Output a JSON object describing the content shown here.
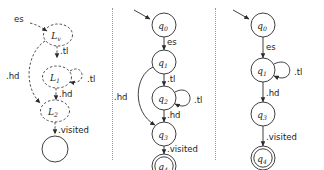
{
  "figure": {
    "background_color": "#ffffff",
    "stroke_color": "#2b2b2b",
    "divider_style": "dotted"
  },
  "panels": [
    {
      "id": "left",
      "style": "dashed",
      "nodes": [
        {
          "id": "Lv",
          "base": "L",
          "subscript": "v",
          "shape": "dashed-ellipse",
          "accepting": false
        },
        {
          "id": "L1",
          "base": "L",
          "subscript": "1",
          "shape": "dashed-ellipse",
          "accepting": false
        },
        {
          "id": "L2",
          "base": "L",
          "subscript": "2",
          "shape": "dashed-ellipse",
          "accepting": false
        },
        {
          "id": "final",
          "base": "",
          "subscript": "",
          "shape": "solid-circle",
          "accepting": false
        }
      ],
      "edges": [
        {
          "from": "start",
          "to": "Lv",
          "label": "es",
          "style": "dashed"
        },
        {
          "from": "Lv",
          "to": "L1",
          "label": ".tl",
          "style": "dashed"
        },
        {
          "from": "L1",
          "to": "L1",
          "label": ".tl",
          "style": "dashed",
          "self_loop": true
        },
        {
          "from": "L1",
          "to": "L2",
          "label": ".hd",
          "style": "dashed"
        },
        {
          "from": "Lv",
          "to": "L2",
          "label": ".hd",
          "style": "dashed",
          "arc": true
        },
        {
          "from": "L2",
          "to": "final",
          "label": ".visited",
          "style": "dashed"
        }
      ]
    },
    {
      "id": "middle",
      "style": "solid",
      "nodes": [
        {
          "id": "q0",
          "base": "q",
          "subscript": "0",
          "shape": "solid-circle",
          "accepting": false
        },
        {
          "id": "q1",
          "base": "q",
          "subscript": "1",
          "shape": "solid-circle",
          "accepting": false
        },
        {
          "id": "q2",
          "base": "q",
          "subscript": "2",
          "shape": "solid-circle",
          "accepting": false
        },
        {
          "id": "q3",
          "base": "q",
          "subscript": "3",
          "shape": "solid-circle",
          "accepting": false
        },
        {
          "id": "q4",
          "base": "q",
          "subscript": "4",
          "shape": "double-circle",
          "accepting": true
        }
      ],
      "edges": [
        {
          "from": "start",
          "to": "q0",
          "label": "",
          "style": "solid"
        },
        {
          "from": "q0",
          "to": "q1",
          "label": "es",
          "style": "solid"
        },
        {
          "from": "q1",
          "to": "q2",
          "label": ".tl",
          "style": "solid"
        },
        {
          "from": "q2",
          "to": "q2",
          "label": ".tl",
          "style": "solid",
          "self_loop": true
        },
        {
          "from": "q2",
          "to": "q3",
          "label": ".hd",
          "style": "solid"
        },
        {
          "from": "q1",
          "to": "q3",
          "label": ".hd",
          "style": "solid",
          "arc": true
        },
        {
          "from": "q3",
          "to": "q4",
          "label": ".visited",
          "style": "solid"
        }
      ]
    },
    {
      "id": "right",
      "style": "solid",
      "nodes": [
        {
          "id": "q0",
          "base": "q",
          "subscript": "0",
          "shape": "solid-circle",
          "accepting": false
        },
        {
          "id": "q1",
          "base": "q",
          "subscript": "1",
          "shape": "solid-circle",
          "accepting": false
        },
        {
          "id": "q3",
          "base": "q",
          "subscript": "3",
          "shape": "solid-circle",
          "accepting": false
        },
        {
          "id": "q4",
          "base": "q",
          "subscript": "4",
          "shape": "double-circle",
          "accepting": true
        }
      ],
      "edges": [
        {
          "from": "start",
          "to": "q0",
          "label": "",
          "style": "solid"
        },
        {
          "from": "q0",
          "to": "q1",
          "label": "es",
          "style": "solid"
        },
        {
          "from": "q1",
          "to": "q1",
          "label": ".tl",
          "style": "solid",
          "self_loop": true
        },
        {
          "from": "q1",
          "to": "q3",
          "label": ".hd",
          "style": "solid"
        },
        {
          "from": "q3",
          "to": "q4",
          "label": ".visited",
          "style": "solid"
        }
      ]
    }
  ],
  "labels": {
    "es": "es",
    "tl": ".tl",
    "hd": ".hd",
    "visited": ".visited",
    "Lv_base": "L",
    "Lv_sub": "v",
    "L1_base": "L",
    "L1_sub": "1",
    "L2_base": "L",
    "L2_sub": "2",
    "q0_base": "q",
    "q0_sub": "0",
    "q1_base": "q",
    "q1_sub": "1",
    "q2_base": "q",
    "q2_sub": "2",
    "q3_base": "q",
    "q3_sub": "3",
    "q4_base": "q",
    "q4_sub": "4"
  }
}
